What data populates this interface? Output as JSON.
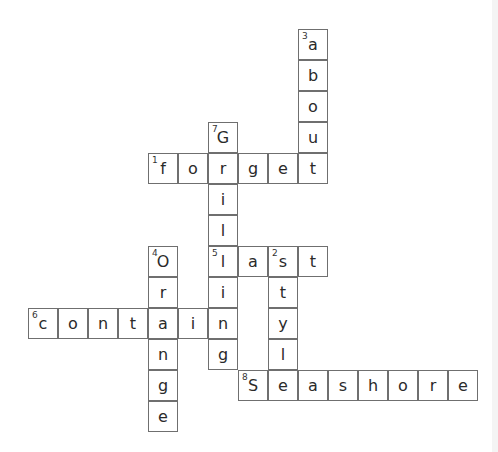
{
  "puzzle": {
    "grid": {
      "origin_x": 28,
      "origin_y": 29,
      "cell_width": 30,
      "cell_height": 31,
      "cells": [
        {
          "row": 0,
          "col": 9,
          "letter": "a",
          "number": "3"
        },
        {
          "row": 1,
          "col": 9,
          "letter": "b"
        },
        {
          "row": 2,
          "col": 9,
          "letter": "o"
        },
        {
          "row": 3,
          "col": 6,
          "letter": "G",
          "number": "7"
        },
        {
          "row": 3,
          "col": 9,
          "letter": "u"
        },
        {
          "row": 4,
          "col": 4,
          "letter": "f",
          "number": "1"
        },
        {
          "row": 4,
          "col": 5,
          "letter": "o"
        },
        {
          "row": 4,
          "col": 6,
          "letter": "r"
        },
        {
          "row": 4,
          "col": 7,
          "letter": "g"
        },
        {
          "row": 4,
          "col": 8,
          "letter": "e"
        },
        {
          "row": 4,
          "col": 9,
          "letter": "t"
        },
        {
          "row": 5,
          "col": 6,
          "letter": "i"
        },
        {
          "row": 6,
          "col": 6,
          "letter": "l"
        },
        {
          "row": 7,
          "col": 4,
          "letter": "O",
          "number": "4"
        },
        {
          "row": 7,
          "col": 6,
          "letter": "l",
          "number": "5"
        },
        {
          "row": 7,
          "col": 7,
          "letter": "a"
        },
        {
          "row": 7,
          "col": 8,
          "letter": "s",
          "number": "2"
        },
        {
          "row": 7,
          "col": 9,
          "letter": "t"
        },
        {
          "row": 8,
          "col": 4,
          "letter": "r"
        },
        {
          "row": 8,
          "col": 6,
          "letter": "i"
        },
        {
          "row": 8,
          "col": 8,
          "letter": "t"
        },
        {
          "row": 9,
          "col": 0,
          "letter": "c",
          "number": "6"
        },
        {
          "row": 9,
          "col": 1,
          "letter": "o"
        },
        {
          "row": 9,
          "col": 2,
          "letter": "n"
        },
        {
          "row": 9,
          "col": 3,
          "letter": "t"
        },
        {
          "row": 9,
          "col": 4,
          "letter": "a"
        },
        {
          "row": 9,
          "col": 5,
          "letter": "i"
        },
        {
          "row": 9,
          "col": 6,
          "letter": "n"
        },
        {
          "row": 9,
          "col": 8,
          "letter": "y"
        },
        {
          "row": 10,
          "col": 4,
          "letter": "n"
        },
        {
          "row": 10,
          "col": 6,
          "letter": "g"
        },
        {
          "row": 10,
          "col": 8,
          "letter": "l"
        },
        {
          "row": 11,
          "col": 4,
          "letter": "g"
        },
        {
          "row": 11,
          "col": 7,
          "letter": "S",
          "number": "8"
        },
        {
          "row": 11,
          "col": 8,
          "letter": "e"
        },
        {
          "row": 11,
          "col": 9,
          "letter": "a"
        },
        {
          "row": 11,
          "col": 10,
          "letter": "s"
        },
        {
          "row": 11,
          "col": 11,
          "letter": "h"
        },
        {
          "row": 11,
          "col": 12,
          "letter": "o"
        },
        {
          "row": 11,
          "col": 13,
          "letter": "r"
        },
        {
          "row": 11,
          "col": 14,
          "letter": "e"
        },
        {
          "row": 12,
          "col": 4,
          "letter": "e"
        }
      ]
    },
    "words": {
      "across": [
        {
          "number": "1",
          "answer": "forget"
        },
        {
          "number": "5",
          "answer": "last"
        },
        {
          "number": "6",
          "answer": "contain"
        },
        {
          "number": "8",
          "answer": "Seashore"
        }
      ],
      "down": [
        {
          "number": "2",
          "answer": "style"
        },
        {
          "number": "3",
          "answer": "about"
        },
        {
          "number": "4",
          "answer": "Orange"
        },
        {
          "number": "7",
          "answer": "Grilling"
        }
      ]
    }
  }
}
